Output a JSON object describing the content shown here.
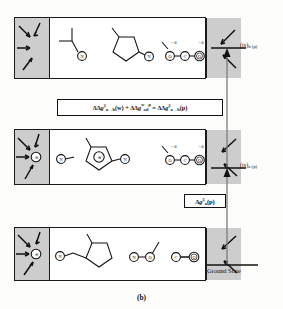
{
  "figure": {
    "caption": "(b)",
    "type": "free-energy diagram with solvated molecular states"
  },
  "energy_axis": {
    "ground_state_label": "Ground State",
    "levels": [
      {
        "id": "ts-b-p",
        "main": "(ts)",
        "sub": "b (p)",
        "y": 48
      },
      {
        "id": "ts-a-p",
        "main": "(ts)",
        "sub": "a (p)",
        "y": 168
      },
      {
        "id": "ground",
        "main": "",
        "sub": "",
        "y": 265
      }
    ]
  },
  "equations": {
    "main": {
      "id": "equation-main",
      "text": "ΔΔ g‡ a→b (w) + ΔΔ g sol w→p = ΔΔ g‡ a→b (p)",
      "parts": {
        "t1_dd": "ΔΔ",
        "t1_g": "g",
        "t1_dagger": "‡",
        "t1_sub": "a→b",
        "t1_state": "(w)",
        "plus": "+",
        "t2_dd": "ΔΔ",
        "t2_g": "g",
        "t2_sub": "sol",
        "t2_sup": "w→p",
        "equals": "=",
        "t3_dd": "ΔΔ",
        "t3_g": "g",
        "t3_dagger": "‡",
        "t3_sub": "a→b",
        "t3_state": "(p)"
      }
    },
    "small": {
      "id": "equation-small",
      "text": "Δ g‡ a (p)",
      "parts": {
        "d": "Δ",
        "g": "g",
        "dagger": "‡",
        "sub": "a",
        "state": "(p)"
      }
    }
  },
  "panels": [
    {
      "id": "panel-top",
      "state": "transition-state-b",
      "left_solvent": {
        "shaded": true,
        "arrows": 4
      },
      "right_solvent": {
        "shaded": true,
        "arrows": 2
      },
      "species": [
        {
          "name": "branched-alkyl-with-leaving-atom",
          "atoms": [
            "N"
          ]
        },
        {
          "name": "methylcyclopentane-ring",
          "atoms": [
            "N"
          ]
        },
        {
          "name": "oco-linear-fragment",
          "atoms": [
            "O",
            "C",
            "O"
          ],
          "charges": [
            "−δ",
            "−δ"
          ]
        }
      ]
    },
    {
      "id": "panel-middle",
      "state": "transition-state-a",
      "left_solvent": {
        "shaded": true,
        "arrows": 4,
        "center_atom": "⊖"
      },
      "right_solvent": {
        "shaded": true,
        "arrows": 2
      },
      "species": [
        {
          "name": "methylcyclopentyl-cation",
          "atoms": [
            "N",
            "⊕",
            "N"
          ]
        },
        {
          "name": "oco-linear-fragment",
          "atoms": [
            "O",
            "C",
            "O"
          ],
          "charges": [
            "−δ",
            "−δ"
          ]
        }
      ]
    },
    {
      "id": "panel-bottom",
      "state": "ground-state",
      "left_solvent": {
        "shaded": true,
        "arrows": 4,
        "center_atom": "⊖"
      },
      "right_solvent": {
        "shaded": true,
        "arrows": 2
      },
      "species": [
        {
          "name": "methylcyclopentane-neutral",
          "atoms": [
            "N"
          ]
        },
        {
          "name": "n-o-methyl-fragment",
          "atoms": [
            "N",
            "O"
          ]
        },
        {
          "name": "c-o-fragment",
          "atoms": [
            "C",
            "O"
          ]
        }
      ]
    }
  ],
  "charges": {
    "delta_negative": "−δ",
    "plus_circle": "⊕",
    "minus_circle": "⊖"
  },
  "atom_labels": {
    "n": "N",
    "o": "O",
    "c": "C"
  }
}
